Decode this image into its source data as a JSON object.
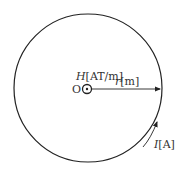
{
  "diagram": {
    "center_label": "O",
    "field_label": {
      "symbol": "H",
      "unit": "[AT/m]"
    },
    "radius_label": {
      "symbol": "r",
      "unit": "[m]"
    },
    "current_label": {
      "symbol": "I",
      "unit": "[A]"
    },
    "colors": {
      "stroke": "#222222",
      "text": "#333333"
    }
  }
}
